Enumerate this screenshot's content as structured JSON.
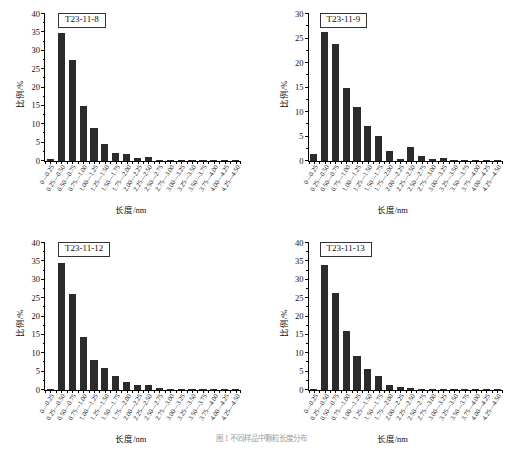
{
  "figure": {
    "caption": "图 1  不同样品中颗粒长度分布",
    "axis": {
      "ylabel": "比例/%",
      "xlabel": "长度/nm"
    },
    "bar_color": "#2b2b2b"
  },
  "categories": [
    "0—0.25",
    "0.25—0.50",
    "0.50—0.75",
    "0.75—1.00",
    "1.00—1.25",
    "1.25—1.50",
    "1.50—1.75",
    "1.75—2.00",
    "2.00—2.25",
    "2.25—2.50",
    "2.50—2.75",
    "2.75—3.00",
    "3.00—3.25",
    "3.25—3.50",
    "3.50—3.75",
    "3.75—4.00",
    "4.00—4.25",
    "4.25—4.50"
  ],
  "chart_data": [
    {
      "type": "bar",
      "title": "T23-11-8",
      "xlabel": "长度/nm",
      "ylabel": "比例/%",
      "ylim": [
        0,
        40
      ],
      "yticks": [
        0,
        5,
        10,
        15,
        20,
        25,
        30,
        35,
        40
      ],
      "grid": false,
      "legend": "none",
      "categories": [
        "0—0.25",
        "0.25—0.50",
        "0.50—0.75",
        "0.75—1.00",
        "1.00—1.25",
        "1.25—1.50",
        "1.50—1.75",
        "1.75—2.00",
        "2.00—2.25",
        "2.25—2.50",
        "2.50—2.75",
        "2.75—3.00",
        "3.00—3.25",
        "3.25—3.50",
        "3.50—3.75",
        "3.75—4.00",
        "4.00—4.25",
        "4.25—4.50"
      ],
      "values": [
        0.5,
        34.9,
        27.6,
        15.0,
        9.1,
        4.7,
        2.3,
        2.0,
        0.7,
        1.1,
        0.3,
        0.2,
        0.15,
        0.1,
        0.1,
        0.1,
        0.05,
        0.05
      ]
    },
    {
      "type": "bar",
      "title": "T23-11-9",
      "xlabel": "长度/nm",
      "ylabel": "比例/%",
      "ylim": [
        0,
        30
      ],
      "yticks": [
        0,
        5,
        10,
        15,
        20,
        25,
        30
      ],
      "grid": false,
      "legend": "none",
      "categories": [
        "0—0.25",
        "0.25—0.50",
        "0.50—0.75",
        "0.75—1.00",
        "1.00—1.25",
        "1.25—1.50",
        "1.50—1.75",
        "1.75—2.00",
        "2.00—2.25",
        "2.25—2.50",
        "2.50—2.75",
        "2.75—3.00",
        "3.00—3.25",
        "3.25—3.50",
        "3.50—3.75",
        "3.75—4.00",
        "4.00—4.25",
        "4.25—4.50"
      ],
      "values": [
        1.4,
        26.4,
        23.8,
        14.8,
        11.1,
        7.2,
        5.1,
        2.0,
        0.4,
        2.9,
        1.0,
        0.5,
        0.6,
        0.3,
        0.25,
        0.2,
        0.15,
        0.15
      ]
    },
    {
      "type": "bar",
      "title": "T23-11-12",
      "xlabel": "长度/nm",
      "ylabel": "比例/%",
      "ylim": [
        0,
        40
      ],
      "yticks": [
        0,
        5,
        10,
        15,
        20,
        25,
        30,
        35,
        40
      ],
      "grid": false,
      "legend": "none",
      "categories": [
        "0—0.25",
        "0.25—0.50",
        "0.50—0.75",
        "0.75—1.00",
        "1.00—1.25",
        "1.25—1.50",
        "1.50—1.75",
        "1.75—2.00",
        "2.00—2.25",
        "2.25—2.50",
        "2.50—2.75",
        "2.75—3.00",
        "3.00—3.25",
        "3.25—3.50",
        "3.50—3.75",
        "3.75—4.00",
        "4.00—4.25",
        "4.25—4.50"
      ],
      "values": [
        0.2,
        34.6,
        26.1,
        14.4,
        8.1,
        5.9,
        3.7,
        2.1,
        1.5,
        1.4,
        0.6,
        0.2,
        0.1,
        0.15,
        0.1,
        0.1,
        0.08,
        0.05
      ]
    },
    {
      "type": "bar",
      "title": "T23-11-13",
      "xlabel": "长度/nm",
      "ylabel": "比例/%",
      "ylim": [
        0,
        40
      ],
      "yticks": [
        0,
        5,
        10,
        15,
        20,
        25,
        30,
        35,
        40
      ],
      "grid": false,
      "legend": "none",
      "categories": [
        "0—0.25",
        "0.25—0.50",
        "0.50—0.75",
        "0.75—1.00",
        "1.00—1.25",
        "1.25—1.50",
        "1.50—1.75",
        "1.75—2.00",
        "2.00—2.25",
        "2.25—2.50",
        "2.50—2.75",
        "2.75—3.00",
        "3.00—3.25",
        "3.25—3.50",
        "3.50—3.75",
        "3.75—4.00",
        "4.00—4.25",
        "4.25—4.50"
      ],
      "values": [
        0.2,
        33.9,
        26.3,
        16.0,
        9.3,
        5.7,
        3.8,
        1.4,
        0.7,
        0.6,
        0.3,
        0.25,
        0.2,
        0.1,
        0.1,
        0.1,
        0.05,
        0.05
      ]
    }
  ]
}
